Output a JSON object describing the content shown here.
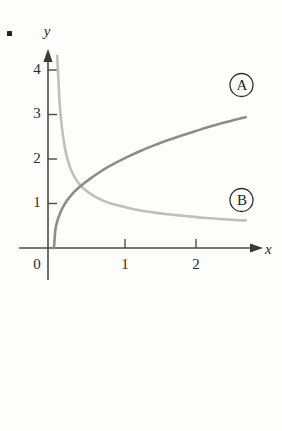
{
  "figure": {
    "bullet_marker": "•",
    "background_color": "#fdfdfc"
  },
  "chart_data": {
    "type": "line",
    "title": "",
    "subtitle": "",
    "xlabel": "x",
    "ylabel": "y",
    "grid": false,
    "legend_position": "inline-right",
    "xlim": [
      0,
      2.75
    ],
    "ylim": [
      0,
      4.6
    ],
    "xticks": [
      1,
      2
    ],
    "xtick_labels": [
      "1",
      "2"
    ],
    "yticks": [
      1,
      2,
      3,
      4
    ],
    "ytick_labels": [
      "1",
      "2",
      "3",
      "4"
    ],
    "origin_label": "0",
    "annotations": [
      {
        "name": "curve-a-callout",
        "text": "A",
        "shape": "circled",
        "x": 2.45,
        "y": 3.85
      },
      {
        "name": "curve-b-callout",
        "text": "B",
        "shape": "circled",
        "x": 2.45,
        "y": 1.15
      }
    ],
    "series": [
      {
        "name": "A",
        "label": "A",
        "color": "#8c8c8c",
        "linewidth": 2.6,
        "description": "increasing concave curve, power/root shape",
        "x": [
          0.0,
          0.02,
          0.05,
          0.08,
          0.12,
          0.18,
          0.25,
          0.33,
          0.42,
          0.52,
          0.62,
          0.75,
          0.9,
          1.05,
          1.2,
          1.4,
          1.6,
          1.8,
          2.0,
          2.2,
          2.4,
          2.55,
          2.7
        ],
        "y": [
          0.0,
          0.42,
          0.62,
          0.76,
          0.9,
          1.06,
          1.2,
          1.33,
          1.45,
          1.57,
          1.68,
          1.81,
          1.94,
          2.06,
          2.17,
          2.3,
          2.42,
          2.53,
          2.63,
          2.73,
          2.82,
          2.88,
          2.94
        ]
      },
      {
        "name": "B",
        "label": "B",
        "color": "#bfbfbf",
        "linewidth": 2.6,
        "description": "decreasing convex curve, reciprocal/decay shape",
        "x": [
          0.045,
          0.06,
          0.08,
          0.1,
          0.13,
          0.17,
          0.22,
          0.28,
          0.36,
          0.45,
          0.56,
          0.7,
          0.85,
          1.0,
          1.2,
          1.4,
          1.6,
          1.85,
          2.1,
          2.35,
          2.55,
          2.7
        ],
        "y": [
          4.32,
          3.85,
          3.25,
          2.88,
          2.48,
          2.12,
          1.84,
          1.62,
          1.43,
          1.29,
          1.17,
          1.06,
          0.98,
          0.92,
          0.85,
          0.8,
          0.76,
          0.72,
          0.68,
          0.65,
          0.63,
          0.62
        ]
      }
    ]
  },
  "axes": {
    "x_axis_name": "x",
    "y_axis_name": "y",
    "x_arrow": true,
    "y_arrow": true
  }
}
